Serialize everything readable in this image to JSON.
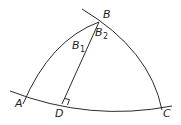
{
  "diagram": {
    "type": "spherical-triangle",
    "stroke_color": "#2b2b2b",
    "background": "#ffffff",
    "labels": {
      "A": "A",
      "B": "B",
      "B1_main": "B",
      "B1_sub": "1",
      "B2_main": "B",
      "B2_sub": "2",
      "C": "C",
      "D": "D"
    },
    "annotations": {
      "right_angle_at": "D"
    }
  }
}
